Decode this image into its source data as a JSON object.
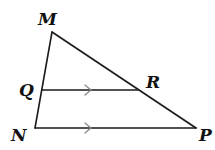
{
  "diagram": {
    "type": "triangle-with-parallel-segment",
    "points": {
      "M": {
        "label": "M",
        "x": 52,
        "y": 32
      },
      "Q": {
        "label": "Q",
        "x": 42,
        "y": 90
      },
      "N": {
        "label": "N",
        "x": 35,
        "y": 128
      },
      "R": {
        "label": "R",
        "x": 138,
        "y": 90
      },
      "P": {
        "label": "P",
        "x": 196,
        "y": 128
      }
    },
    "segments": [
      {
        "from": "M",
        "to": "N"
      },
      {
        "from": "M",
        "to": "P"
      },
      {
        "from": "N",
        "to": "P",
        "parallel_mark": true
      },
      {
        "from": "Q",
        "to": "R",
        "parallel_mark": true
      }
    ],
    "relations": [
      "QR ∥ NP"
    ],
    "colors": {
      "line": "#1a1a1a",
      "parallel_mark": "#8a8a8a",
      "label": "#111111",
      "background": "#ffffff"
    }
  }
}
